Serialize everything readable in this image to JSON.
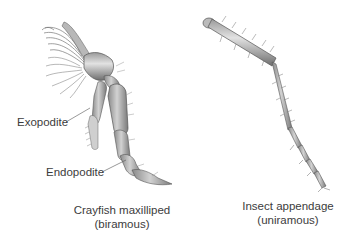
{
  "figure": {
    "left_panel": {
      "labels": {
        "exopodite": "Exopodite",
        "endopodite": "Endopodite"
      },
      "caption_line1": "Crayfish maxilliped",
      "caption_line2": "(biramous)"
    },
    "right_panel": {
      "caption_line1": "Insect appendage",
      "caption_line2": "(uniramous)"
    }
  }
}
